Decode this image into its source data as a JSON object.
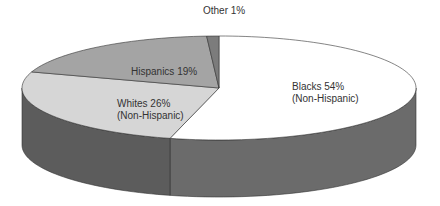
{
  "chart_data": {
    "type": "pie",
    "style": "3d-pie",
    "title": "",
    "categories": [
      "Blacks (Non-Hispanic)",
      "Whites (Non-Hispanic)",
      "Hispanics",
      "Other"
    ],
    "values": [
      54,
      26,
      19,
      1
    ],
    "unit": "%",
    "labels": [
      {
        "line1": "Blacks 54%",
        "line2": "(Non-Hispanic)"
      },
      {
        "line1": "Whites 26%",
        "line2": "(Non-Hispanic)"
      },
      {
        "line1": "Hispanics 19%",
        "line2": ""
      },
      {
        "line1": "Other 1%",
        "line2": ""
      }
    ],
    "colors": [
      "#ffffff",
      "#d6d6d6",
      "#a4a4a4",
      "#7c7c7c"
    ],
    "wall_colors": {
      "left": "#5c5c5c",
      "right": "#6b6b6b"
    },
    "legend": "none"
  }
}
